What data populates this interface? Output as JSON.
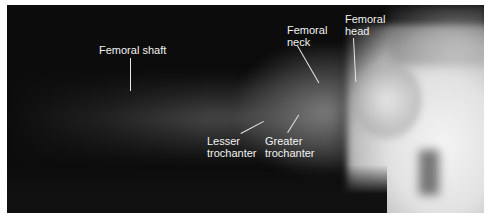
{
  "image": {
    "description": "Lateral radiograph of the hip showing the proximal femur",
    "background_color": "#0c0c0c",
    "label_color": "#f2f2f2"
  },
  "labels": [
    {
      "id": "femoral-shaft",
      "text": "Femoral shaft"
    },
    {
      "id": "femoral-neck",
      "line1": "Femoral",
      "line2": "neck"
    },
    {
      "id": "femoral-head",
      "line1": "Femoral",
      "line2": "head"
    },
    {
      "id": "lesser-trochanter",
      "line1": "Lesser",
      "line2": "trochanter"
    },
    {
      "id": "greater-trochanter",
      "line1": "Greater",
      "line2": "trochanter"
    }
  ]
}
